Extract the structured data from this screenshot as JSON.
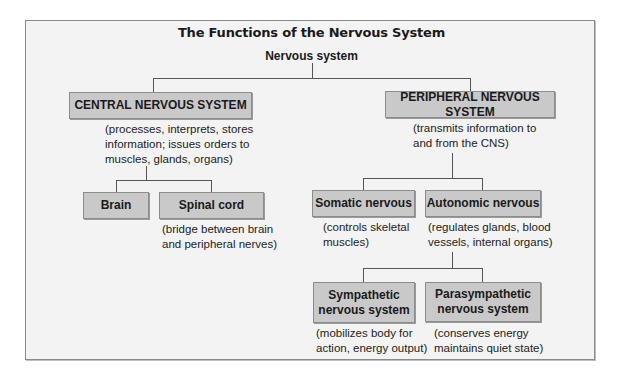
{
  "title": "The Functions of the Nervous System",
  "root": "Nervous system",
  "cns": {
    "label": "CENTRAL NERVOUS SYSTEM",
    "desc": [
      "(processes, interprets, stores",
      "information; issues orders to",
      "muscles, glands, organs)"
    ],
    "children": [
      {
        "label": "Brain",
        "desc": []
      },
      {
        "label": "Spinal cord",
        "desc": [
          "(bridge between brain",
          "and peripheral nerves)"
        ]
      }
    ]
  },
  "pns": {
    "label": "PERIPHERAL NERVOUS SYSTEM",
    "desc": [
      "(transmits information to",
      "and from the CNS)"
    ],
    "children": [
      {
        "label": "Somatic nervous",
        "desc": [
          "(controls skeletal",
          "muscles)"
        ]
      },
      {
        "label": "Autonomic nervous",
        "desc": [
          "(regulates glands, blood",
          "vessels, internal organs)"
        ],
        "children": [
          {
            "label": [
              "Sympathetic",
              "nervous system"
            ],
            "desc": [
              "(mobilizes body for",
              "action, energy output)"
            ]
          },
          {
            "label": [
              "Parasympathetic",
              "nervous system"
            ],
            "desc": [
              "(conserves energy",
              "maintains quiet state)"
            ]
          }
        ]
      }
    ]
  },
  "colors": {
    "box_fill": "#c9c9c9",
    "panel_bg": "#f3f3f3",
    "line": "#555555"
  }
}
